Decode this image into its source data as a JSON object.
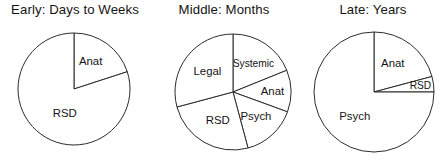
{
  "figure": {
    "background_color": "#ffffff",
    "stroke_color": "#2b2b2b",
    "text_color": "#141414"
  },
  "panels": [
    {
      "id": "early",
      "title": "Early: Days to Weeks",
      "title_name": "panel-title-early"
    },
    {
      "id": "middle",
      "title": "Middle: Months",
      "title_name": "panel-title-middle"
    },
    {
      "id": "late",
      "title": "Late: Years",
      "title_name": "panel-title-late"
    }
  ],
  "chart_data": [
    {
      "type": "pie",
      "title": "Early: Days to Weeks",
      "categories": [
        "Anat",
        "RSD"
      ],
      "values": [
        20,
        80
      ],
      "start_angle_deg": 0,
      "direction": "clockwise",
      "labels_inside": true,
      "legend": "none",
      "slices": [
        {
          "label": "Anat",
          "value": 20,
          "start_deg": 0,
          "end_deg": 72,
          "label_r": 0.56,
          "label_angle_deg": 32
        },
        {
          "label": "RSD",
          "value": 80,
          "start_deg": 72,
          "end_deg": 360,
          "label_r": 0.48,
          "label_angle_deg": 200
        }
      ]
    },
    {
      "type": "pie",
      "title": "Middle: Months",
      "categories": [
        "Systemic",
        "Anat",
        "Psych",
        "RSD",
        "Legal"
      ],
      "values": [
        19,
        12,
        15,
        25,
        29
      ],
      "start_angle_deg": 0,
      "direction": "clockwise",
      "labels_inside": true,
      "legend": "none",
      "slices": [
        {
          "label": "Systemic",
          "value": 19,
          "start_deg": 0,
          "end_deg": 68,
          "label_r": 0.6,
          "label_angle_deg": 36
        },
        {
          "label": "Anat",
          "value": 12,
          "start_deg": 68,
          "end_deg": 110,
          "label_r": 0.68,
          "label_angle_deg": 90
        },
        {
          "label": "Psych",
          "value": 15,
          "start_deg": 110,
          "end_deg": 165,
          "label_r": 0.58,
          "label_angle_deg": 137
        },
        {
          "label": "RSD",
          "value": 25,
          "start_deg": 165,
          "end_deg": 255,
          "label_r": 0.56,
          "label_angle_deg": 208
        },
        {
          "label": "Legal",
          "value": 29,
          "start_deg": 255,
          "end_deg": 360,
          "label_r": 0.56,
          "label_angle_deg": 308
        }
      ]
    },
    {
      "type": "pie",
      "title": "Late: Years",
      "categories": [
        "Anat",
        "RSD",
        "Psych"
      ],
      "values": [
        21,
        4,
        75
      ],
      "start_angle_deg": 0,
      "direction": "clockwise",
      "labels_inside": true,
      "legend": "none",
      "slices": [
        {
          "label": "Anat",
          "value": 21,
          "start_deg": 0,
          "end_deg": 75,
          "label_r": 0.56,
          "label_angle_deg": 34
        },
        {
          "label": "RSD",
          "value": 4,
          "start_deg": 75,
          "end_deg": 90,
          "label_r": 0.78,
          "label_angle_deg": 83
        },
        {
          "label": "Psych",
          "value": 75,
          "start_deg": 90,
          "end_deg": 360,
          "label_r": 0.52,
          "label_angle_deg": 218
        }
      ]
    }
  ],
  "geometry": [
    {
      "left": 2,
      "width": 146,
      "cx": 72,
      "cy": 89,
      "r": 56
    },
    {
      "left": 150,
      "width": 148,
      "cx": 83,
      "cy": 92,
      "r": 58
    },
    {
      "left": 300,
      "width": 146,
      "cx": 74,
      "cy": 92,
      "r": 60
    }
  ]
}
